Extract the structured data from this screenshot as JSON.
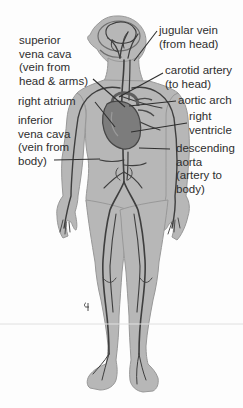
{
  "figure": {
    "colors": {
      "background": "#fdfdfd",
      "body_fill": "#b7b7b7",
      "body_outline": "#989898",
      "vessel": "#3e3e3e",
      "heart_fill": "#7c7c7c",
      "heart_outline": "#454545",
      "label_text": "#2e2e2e",
      "leader_line": "#2f2f2f",
      "faint_rule": "#e0e0e0"
    }
  },
  "labels": {
    "left": [
      {
        "name": "superior-vena-cava",
        "lines": [
          "superior",
          "vena cava",
          "(vein from",
          "head & arms)"
        ]
      },
      {
        "name": "right-atrium",
        "lines": [
          "right atrium"
        ]
      },
      {
        "name": "inferior-vena-cava",
        "lines": [
          "inferior",
          "vena cava",
          "(vein from",
          "body)"
        ]
      }
    ],
    "right": [
      {
        "name": "jugular-vein",
        "lines": [
          "jugular vein",
          "(from head)"
        ]
      },
      {
        "name": "carotid-artery",
        "lines": [
          "carotid artery",
          "(to head)"
        ]
      },
      {
        "name": "aortic-arch",
        "lines": [
          "aortic arch"
        ]
      },
      {
        "name": "right-ventricle",
        "lines": [
          "right",
          "ventricle"
        ]
      },
      {
        "name": "descending-aorta",
        "lines": [
          "descending",
          "aorta",
          "(artery to",
          "body)"
        ]
      }
    ]
  }
}
